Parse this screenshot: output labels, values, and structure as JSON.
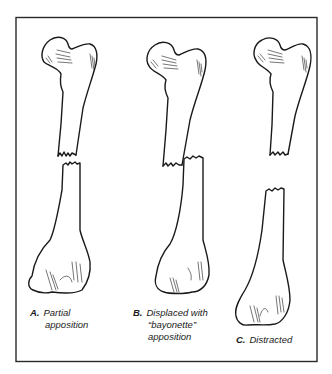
{
  "figure": {
    "type": "medical-illustration",
    "colors": {
      "ink": "#1a1a1a",
      "background": "#ffffff",
      "frame": "#2a2a2a"
    },
    "panels": [
      {
        "id": "A",
        "letter": "A.",
        "line1": "Partial",
        "line2": "apposition",
        "line3": ""
      },
      {
        "id": "B",
        "letter": "B.",
        "line1": "Displaced with",
        "line2": "“bayonette”",
        "line3": "apposition"
      },
      {
        "id": "C",
        "letter": "C.",
        "line1": "Distracted",
        "line2": "",
        "line3": ""
      }
    ]
  }
}
